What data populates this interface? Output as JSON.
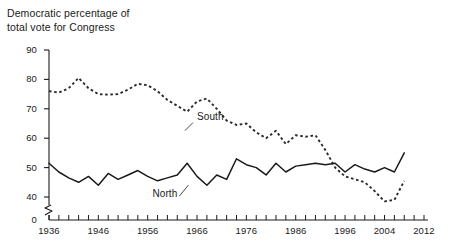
{
  "chart_data": {
    "type": "line",
    "title": "Democratic percentage of\ntotal vote for Congress",
    "title_line1": "Democratic percentage of",
    "title_line2": "total vote for Congress",
    "xlabel": "",
    "ylabel": "",
    "xlim": [
      1936,
      2012
    ],
    "ylim": [
      35,
      90
    ],
    "ylim_display": [
      0,
      90
    ],
    "grid": false,
    "axis_break": true,
    "axis_break_note": "y-axis broken between 0 and 40",
    "legend_position": "inline-annotations",
    "ytick_values": [
      0,
      40,
      50,
      60,
      70,
      80,
      90
    ],
    "ytick_labels": [
      "0",
      "40",
      "50",
      "60",
      "70",
      "80",
      "90"
    ],
    "xtick_values": [
      1936,
      1938,
      1940,
      1942,
      1944,
      1946,
      1948,
      1950,
      1952,
      1954,
      1956,
      1958,
      1960,
      1962,
      1964,
      1966,
      1968,
      1970,
      1972,
      1974,
      1976,
      1978,
      1980,
      1982,
      1984,
      1986,
      1988,
      1990,
      1992,
      1994,
      1996,
      1998,
      2000,
      2002,
      2004,
      2006,
      2008,
      2010,
      2012
    ],
    "xtick_labeled": [
      1936,
      1946,
      1956,
      1966,
      1976,
      1986,
      1996,
      2004,
      2012
    ],
    "xtick_labels": [
      "1936",
      "1946",
      "1956",
      "1966",
      "1976",
      "1986",
      "1996",
      "2004",
      "2012"
    ],
    "x": [
      1936,
      1938,
      1940,
      1942,
      1944,
      1946,
      1948,
      1950,
      1952,
      1954,
      1956,
      1958,
      1960,
      1962,
      1964,
      1966,
      1968,
      1970,
      1972,
      1974,
      1976,
      1978,
      1980,
      1982,
      1984,
      1986,
      1988,
      1990,
      1992,
      1994,
      1996,
      1998,
      2000,
      2002,
      2004,
      2006,
      2008
    ],
    "series": [
      {
        "name": "South",
        "style": "dashed",
        "color": "#2b2b2b",
        "label_x": 1967,
        "label_y": 67,
        "values": [
          76.0,
          75.5,
          77.0,
          80.5,
          77.0,
          75.0,
          74.8,
          75.0,
          76.5,
          78.5,
          78.0,
          76.0,
          73.0,
          71.0,
          69.0,
          72.5,
          73.5,
          70.0,
          66.0,
          64.5,
          65.0,
          62.0,
          60.0,
          62.5,
          58.0,
          61.0,
          60.5,
          61.0,
          56.0,
          50.0,
          47.0,
          46.0,
          45.0,
          42.0,
          38.5,
          39.0,
          45.5
        ]
      },
      {
        "name": "North",
        "style": "solid",
        "color": "#1a1a1a",
        "label_x": 1960,
        "label_y": 41,
        "values": [
          51.5,
          48.5,
          46.5,
          45.0,
          47.0,
          44.0,
          48.0,
          46.0,
          47.5,
          49.0,
          47.0,
          45.5,
          46.5,
          47.5,
          51.5,
          47.0,
          44.0,
          47.5,
          46.0,
          53.0,
          51.0,
          50.0,
          47.5,
          51.5,
          48.5,
          50.5,
          51.0,
          51.5,
          51.0,
          51.5,
          48.5,
          51.0,
          49.5,
          48.5,
          50.0,
          48.5,
          55.0
        ]
      }
    ],
    "annotations": [
      {
        "text": "South",
        "points_to": "dashed-series"
      },
      {
        "text": "North",
        "points_to": "solid-series"
      }
    ]
  }
}
